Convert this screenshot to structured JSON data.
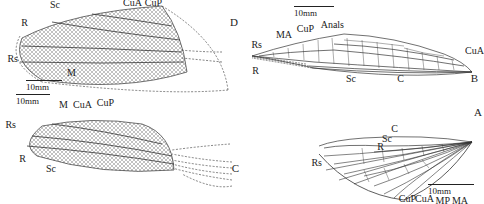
{
  "figure": {
    "orientation": "rotated-180",
    "panels": [
      {
        "id": "A",
        "label": "A",
        "description": "Forewing with fan-shaped radiating veins",
        "vein_labels": [
          "C",
          "Sc",
          "R",
          "Rs",
          "CuP",
          "CuA",
          "MP",
          "MA"
        ],
        "scale_bar": "10mm"
      },
      {
        "id": "B",
        "label": "B",
        "description": "Elongate wing with regular cross-vein reticulation",
        "vein_labels": [
          "B",
          "C",
          "Sc",
          "R",
          "Rs",
          "MA",
          "CuP",
          "Anals",
          "CuA"
        ],
        "scale_bar": "10mm"
      },
      {
        "id": "C",
        "label": "C",
        "description": "Oval wing with dense reticulate venation",
        "vein_labels": [
          "Sc",
          "R",
          "Rs",
          "M",
          "CuA",
          "CuP"
        ],
        "scale_bar": "10mm"
      },
      {
        "id": "D",
        "label": "D",
        "description": "Broad wing with dense reticulate venation and dashed outline",
        "vein_labels": [
          "R",
          "Sc",
          "Rs",
          "M",
          "CuA",
          "CuP"
        ],
        "scale_bar": "10mm"
      }
    ]
  }
}
